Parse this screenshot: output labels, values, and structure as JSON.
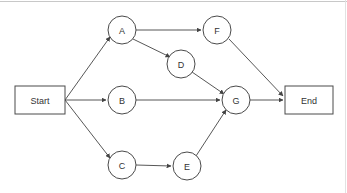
{
  "diagram": {
    "type": "directed-graph",
    "background_color": "#ffffff",
    "node_stroke_color": "#4a4a4a",
    "edge_stroke_color": "#444444",
    "label_color": "#333333",
    "nodes": [
      {
        "id": "start",
        "label": "Start",
        "shape": "rect",
        "x": 40,
        "y": 100,
        "w": 50,
        "h": 28
      },
      {
        "id": "A",
        "label": "A",
        "shape": "circle",
        "x": 122,
        "y": 30,
        "r": 14
      },
      {
        "id": "F",
        "label": "F",
        "shape": "circle",
        "x": 217,
        "y": 30,
        "r": 14
      },
      {
        "id": "D",
        "label": "D",
        "shape": "circle",
        "x": 181,
        "y": 64,
        "r": 14
      },
      {
        "id": "B",
        "label": "B",
        "shape": "circle",
        "x": 122,
        "y": 100,
        "r": 14
      },
      {
        "id": "G",
        "label": "G",
        "shape": "circle",
        "x": 236,
        "y": 100,
        "r": 14
      },
      {
        "id": "C",
        "label": "C",
        "shape": "circle",
        "x": 122,
        "y": 165,
        "r": 14
      },
      {
        "id": "E",
        "label": "E",
        "shape": "circle",
        "x": 187,
        "y": 166,
        "r": 14
      },
      {
        "id": "end",
        "label": "End",
        "shape": "rect",
        "x": 309,
        "y": 100,
        "w": 48,
        "h": 28
      }
    ],
    "edges": [
      {
        "from": "start",
        "to": "A",
        "x1": 65,
        "y1": 100,
        "x2": 110,
        "y2": 37
      },
      {
        "from": "start",
        "to": "B",
        "x1": 65,
        "y1": 100,
        "x2": 106,
        "y2": 100
      },
      {
        "from": "start",
        "to": "C",
        "x1": 65,
        "y1": 100,
        "x2": 110,
        "y2": 158
      },
      {
        "from": "A",
        "to": "F",
        "x1": 136,
        "y1": 30,
        "x2": 201,
        "y2": 30
      },
      {
        "from": "A",
        "to": "D",
        "x1": 133,
        "y1": 39,
        "x2": 170,
        "y2": 57
      },
      {
        "from": "D",
        "to": "G",
        "x1": 192,
        "y1": 72,
        "x2": 224,
        "y2": 94
      },
      {
        "from": "B",
        "to": "G",
        "x1": 136,
        "y1": 100,
        "x2": 220,
        "y2": 100
      },
      {
        "from": "C",
        "to": "E",
        "x1": 136,
        "y1": 165,
        "x2": 171,
        "y2": 166
      },
      {
        "from": "E",
        "to": "G",
        "x1": 196,
        "y1": 156,
        "x2": 226,
        "y2": 110
      },
      {
        "from": "F",
        "to": "end",
        "x1": 229,
        "y1": 39,
        "x2": 283,
        "y2": 96
      },
      {
        "from": "G",
        "to": "end",
        "x1": 250,
        "y1": 100,
        "x2": 283,
        "y2": 100
      }
    ]
  },
  "frame": {
    "top_rule_color": "#c8c8c8",
    "right_rule_color": "#e2e2e2"
  }
}
